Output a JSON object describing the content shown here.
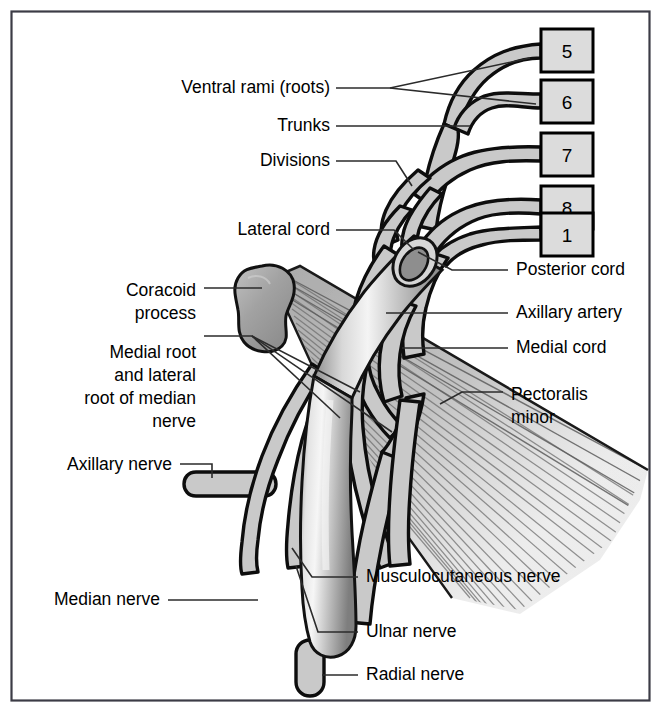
{
  "figure": {
    "border_color": "#3c3c46",
    "background": "#ffffff"
  },
  "palette": {
    "nerve_fill": "#c9c9c9",
    "nerve_outline": "#0d0d0d",
    "bone_fill": "#a8a8a8",
    "muscle_fill": "#b4b4b4",
    "artery_light": "#efefef",
    "artery_dark": "#8c8c8c",
    "box_fill": "#dcdcdc",
    "box_border": "#000000",
    "leader_color": "#2b2b2b",
    "text_color": "#000000"
  },
  "root_boxes": [
    {
      "label": "5",
      "x": 541,
      "y": 29,
      "w": 52,
      "h": 43
    },
    {
      "label": "6",
      "x": 541,
      "y": 80,
      "w": 52,
      "h": 43
    },
    {
      "label": "7",
      "x": 541,
      "y": 133,
      "w": 52,
      "h": 43
    },
    {
      "label": "8",
      "x": 541,
      "y": 186,
      "w": 52,
      "h": 43
    },
    {
      "label": "1",
      "x": 541,
      "y": 213,
      "w": 52,
      "h": 43
    }
  ],
  "labels_left": [
    {
      "id": "ventral-rami",
      "lines": [
        "Ventral rami (roots)"
      ],
      "x": 330,
      "y": 93,
      "anchor": "end"
    },
    {
      "id": "trunks",
      "lines": [
        "Trunks"
      ],
      "x": 330,
      "y": 131,
      "anchor": "end"
    },
    {
      "id": "divisions",
      "lines": [
        "Divisions"
      ],
      "x": 330,
      "y": 166,
      "anchor": "end"
    },
    {
      "id": "lateral-cord",
      "lines": [
        "Lateral cord"
      ],
      "x": 330,
      "y": 235,
      "anchor": "end"
    },
    {
      "id": "coracoid-process",
      "lines": [
        "Coracoid",
        "process"
      ],
      "x": 196,
      "y": 296,
      "anchor": "end"
    },
    {
      "id": "median-roots",
      "lines": [
        "Medial root",
        "and lateral",
        "root of median",
        "nerve"
      ],
      "x": 196,
      "y": 358,
      "anchor": "end"
    },
    {
      "id": "axillary-nerve",
      "lines": [
        "Axillary nerve"
      ],
      "x": 172,
      "y": 470,
      "anchor": "end"
    },
    {
      "id": "median-nerve",
      "lines": [
        "Median nerve"
      ],
      "x": 160,
      "y": 605,
      "anchor": "end"
    }
  ],
  "labels_right": [
    {
      "id": "posterior-cord",
      "lines": [
        "Posterior cord"
      ],
      "x": 516,
      "y": 275,
      "anchor": "start"
    },
    {
      "id": "axillary-artery",
      "lines": [
        "Axillary artery"
      ],
      "x": 516,
      "y": 318,
      "anchor": "start"
    },
    {
      "id": "medial-cord",
      "lines": [
        "Medial cord"
      ],
      "x": 516,
      "y": 353,
      "anchor": "start"
    },
    {
      "id": "pectoralis-minor",
      "lines": [
        "Pectoralis",
        "minor"
      ],
      "x": 511,
      "y": 400,
      "anchor": "start"
    },
    {
      "id": "musculocutaneous-nerve",
      "lines": [
        "Musculocutaneous nerve"
      ],
      "x": 366,
      "y": 582,
      "anchor": "start"
    },
    {
      "id": "ulnar-nerve",
      "lines": [
        "Ulnar nerve"
      ],
      "x": 366,
      "y": 637,
      "anchor": "start"
    },
    {
      "id": "radial-nerve",
      "lines": [
        "Radial nerve"
      ],
      "x": 366,
      "y": 680,
      "anchor": "start"
    }
  ],
  "structures": [
    {
      "id": "coracoid-process",
      "kind": "bone"
    },
    {
      "id": "pectoralis-minor",
      "kind": "muscle"
    },
    {
      "id": "axillary-artery",
      "kind": "artery"
    },
    {
      "id": "lateral-cord",
      "kind": "nerve"
    },
    {
      "id": "posterior-cord",
      "kind": "nerve"
    },
    {
      "id": "medial-cord",
      "kind": "nerve"
    },
    {
      "id": "musculocutaneous-nerve",
      "kind": "nerve"
    },
    {
      "id": "median-nerve",
      "kind": "nerve"
    },
    {
      "id": "ulnar-nerve",
      "kind": "nerve"
    },
    {
      "id": "radial-nerve",
      "kind": "nerve"
    },
    {
      "id": "axillary-nerve",
      "kind": "nerve"
    }
  ]
}
